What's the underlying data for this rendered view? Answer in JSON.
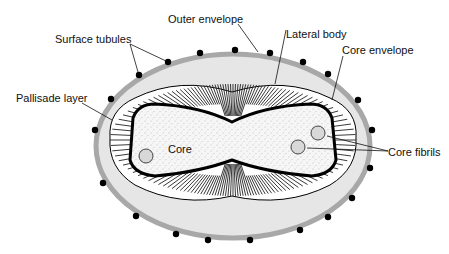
{
  "diagram": {
    "labels": {
      "outer_envelope": "Outer envelope",
      "lateral_body": "Lateral body",
      "surface_tubules": "Surface tubules",
      "core_envelope": "Core envelope",
      "pallisade_layer": "Pallisade layer",
      "core": "Core",
      "core_fibrils": "Core fibrils"
    },
    "colors": {
      "envelope": "#a8a8a8",
      "lateral_body_fill": "#e6e6e6",
      "core_fill": "#f4f4f4",
      "outline": "#000000"
    }
  }
}
